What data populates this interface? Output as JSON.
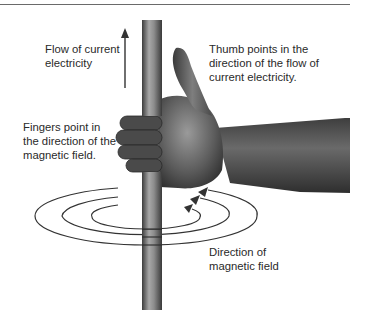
{
  "diagram": {
    "labels": {
      "current_flow": "Flow of current\nelectricity",
      "thumb": "Thumb points in the\ndirection of the flow of\ncurrent electricity.",
      "fingers": "Fingers point in\nthe direction of the\nmagnetic field.",
      "field_direction": "Direction of\nmagnetic field"
    },
    "elements": [
      "conductor-wire",
      "right-hand",
      "current-arrow",
      "magnetic-field-loops"
    ],
    "colors": {
      "text": "#2a2a2a",
      "wire": "#8a8a8a",
      "hand": "#5e5e5e",
      "lines": "#333333",
      "rule": "#6a6a6a"
    }
  }
}
